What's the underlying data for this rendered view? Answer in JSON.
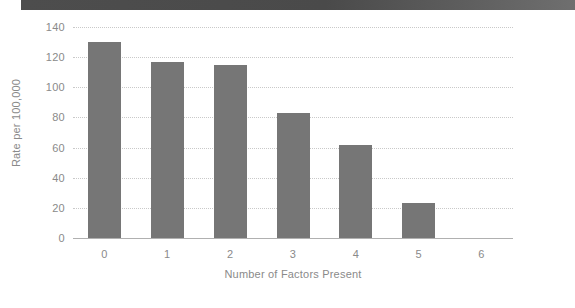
{
  "banner": {
    "name": "top-decorative-bar",
    "color_left": "#4d4d4d",
    "color_right": "#6f6f6f"
  },
  "chart_data": {
    "type": "bar",
    "title": "",
    "subtitle": "",
    "xlabel": "Number of Factors Present",
    "ylabel": "Rate per 100,000",
    "categories": [
      "0",
      "1",
      "2",
      "3",
      "4",
      "5",
      "6"
    ],
    "values": [
      130,
      117,
      115,
      83,
      62,
      23,
      0
    ],
    "ylim": [
      0,
      140
    ],
    "ytick_labels": [
      "140",
      "120",
      "100",
      "80",
      "60",
      "40",
      "20",
      "0"
    ],
    "ytick_values": [
      140,
      120,
      100,
      80,
      60,
      40,
      20,
      0
    ],
    "xtick_labels": [
      "0",
      "1",
      "2",
      "3",
      "4",
      "5",
      "6"
    ],
    "grid": true,
    "grid_style": "dotted",
    "grid_color": "#c9c9c9",
    "legend": null,
    "legend_position": "none",
    "bar_color": "#767676",
    "axis_color": "#b0b0b0",
    "tick_label_color": "#8a8a8a",
    "background": "#ffffff"
  }
}
